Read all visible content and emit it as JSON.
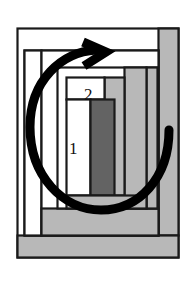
{
  "figure": {
    "type": "nested-rectangle-packing-diagram",
    "title": "",
    "canvas": {
      "width": 196,
      "height": 284,
      "background": "#ffffff"
    },
    "colors": {
      "outline": "#1a1a1a",
      "white_fill": "#ffffff",
      "light_gray_fill": "#b8b8b8",
      "mid_gray_fill": "#a8a8a8",
      "dark_gray_fill": "#636363",
      "arrow": "#000000"
    },
    "labels": [
      {
        "name": "region-label-1",
        "text": "1",
        "x": 69,
        "y": 140
      },
      {
        "name": "region-label-2",
        "text": "2",
        "x": 84,
        "y": 86
      }
    ],
    "rectangles": [
      {
        "name": "outer-frame",
        "x": 17,
        "y": 28,
        "w": 162,
        "h": 230,
        "fill": "#ffffff"
      },
      {
        "name": "right-gray-column",
        "x": 158,
        "y": 28,
        "w": 21,
        "h": 207,
        "fill": "#b8b8b8"
      },
      {
        "name": "bottom-gray-band",
        "x": 17,
        "y": 235,
        "w": 162,
        "h": 23,
        "fill": "#b8b8b8"
      },
      {
        "name": "inner-frame",
        "x": 24,
        "y": 50,
        "w": 134,
        "h": 185,
        "fill": "#ffffff"
      },
      {
        "name": "left-white-column",
        "x": 24,
        "y": 50,
        "w": 17,
        "h": 185,
        "fill": "#ffffff"
      },
      {
        "name": "second-frame",
        "x": 41,
        "y": 50,
        "w": 117,
        "h": 185,
        "fill": "#ffffff"
      },
      {
        "name": "lower-gray-block",
        "x": 41,
        "y": 208,
        "w": 117,
        "h": 27,
        "fill": "#b8b8b8"
      },
      {
        "name": "third-frame",
        "x": 57,
        "y": 67,
        "w": 101,
        "h": 141,
        "fill": "#ffffff"
      },
      {
        "name": "region-2-cell",
        "x": 66,
        "y": 77,
        "w": 38,
        "h": 22,
        "fill": "#ffffff"
      },
      {
        "name": "region-1-cell",
        "x": 66,
        "y": 99,
        "w": 24,
        "h": 96,
        "fill": "#ffffff"
      },
      {
        "name": "dark-bar",
        "x": 90,
        "y": 99,
        "w": 25,
        "h": 96,
        "fill": "#636363"
      },
      {
        "name": "gray-column-mid",
        "x": 104,
        "y": 77,
        "w": 20,
        "h": 118,
        "fill": "#b8b8b8"
      },
      {
        "name": "gray-column-right",
        "x": 124,
        "y": 67,
        "w": 22,
        "h": 141,
        "fill": "#b8b8b8"
      },
      {
        "name": "gray-column-edge",
        "x": 146,
        "y": 67,
        "w": 12,
        "h": 141,
        "fill": "#b8b8b8"
      },
      {
        "name": "gray-strip-under-bar",
        "x": 66,
        "y": 195,
        "w": 80,
        "h": 13,
        "fill": "#b8b8b8"
      }
    ],
    "arrow": {
      "name": "circular-rotation-arrow",
      "shape": "open-circular-ccw-arrow",
      "stroke_width": 9,
      "color": "#000000",
      "head": "top",
      "tail": "right",
      "center": {
        "x": 100,
        "y": 140
      },
      "radius_x": 68,
      "radius_y": 72
    }
  }
}
